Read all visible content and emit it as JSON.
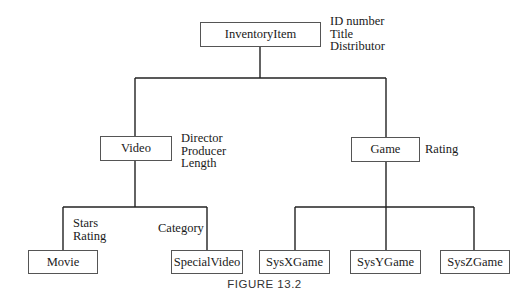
{
  "diagram": {
    "nodes": [
      {
        "id": "inventory_item",
        "label": "InventoryItem",
        "attributes": [
          "ID number",
          "Title",
          "Distributor"
        ]
      },
      {
        "id": "video",
        "label": "Video",
        "attributes": [
          "Director",
          "Producer",
          "Length"
        ]
      },
      {
        "id": "game",
        "label": "Game",
        "attributes": [
          "Rating"
        ]
      },
      {
        "id": "movie",
        "label": "Movie",
        "attributes": [
          "Stars",
          "Rating"
        ]
      },
      {
        "id": "special_video",
        "label": "SpecialVideo",
        "attributes": [
          "Category"
        ]
      },
      {
        "id": "sysx_game",
        "label": "SysXGame",
        "attributes": []
      },
      {
        "id": "sysy_game",
        "label": "SysYGame",
        "attributes": []
      },
      {
        "id": "sysz_game",
        "label": "SysZGame",
        "attributes": []
      }
    ],
    "edges": [
      [
        "inventory_item",
        "video"
      ],
      [
        "inventory_item",
        "game"
      ],
      [
        "video",
        "movie"
      ],
      [
        "video",
        "special_video"
      ],
      [
        "game",
        "sysx_game"
      ],
      [
        "game",
        "sysy_game"
      ],
      [
        "game",
        "sysz_game"
      ]
    ],
    "caption": "FIGURE 13.2"
  }
}
